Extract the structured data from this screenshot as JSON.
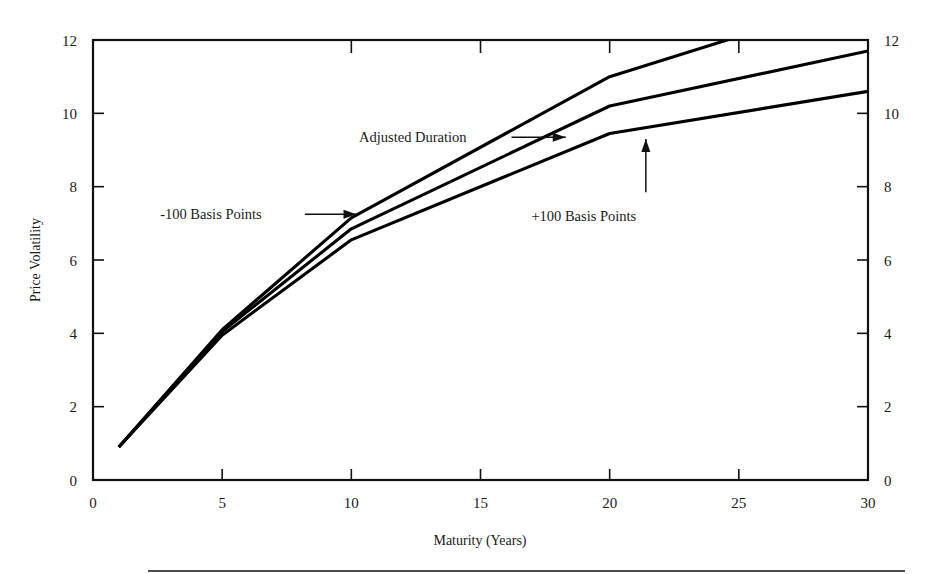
{
  "chart_data": {
    "type": "line",
    "title": "",
    "xlabel": "Maturity (Years)",
    "ylabel": "Price Volatility",
    "xlim": [
      0,
      30
    ],
    "ylim": [
      0,
      12
    ],
    "xticks": [
      0,
      5,
      10,
      15,
      20,
      25,
      30
    ],
    "xticklabels": [
      "0",
      "5",
      "10",
      "15",
      "20",
      "25",
      "30"
    ],
    "yticks": [
      0,
      2,
      4,
      6,
      8,
      10,
      12
    ],
    "yticklabels": [
      "0",
      "2",
      "4",
      "6",
      "8",
      "10",
      "12"
    ],
    "right_axis": true,
    "right_yticks": [
      0,
      2,
      4,
      6,
      8,
      10,
      12
    ],
    "right_yticklabels": [
      "0",
      "2",
      "4",
      "6",
      "8",
      "10",
      "12"
    ],
    "grid": false,
    "legend": "annotations",
    "x": [
      1,
      5,
      10,
      20,
      30
    ],
    "series": [
      {
        "name": "-100 Basis Points",
        "values": [
          0.9,
          4.1,
          7.15,
          11.0,
          13.2
        ],
        "clipped_at_top": true,
        "clip_x": 26.6,
        "clip_y": 12
      },
      {
        "name": "Adjusted Duration",
        "values": [
          0.9,
          4.05,
          6.85,
          10.2,
          11.7
        ]
      },
      {
        "name": "+100 Basis Points",
        "values": [
          0.9,
          3.95,
          6.55,
          9.45,
          10.6
        ]
      }
    ],
    "annotations": [
      {
        "text": "Adjusted Duration",
        "label_x": 10.3,
        "label_y": 9.35,
        "arrow_from_x": 16.2,
        "arrow_from_y": 9.35,
        "arrow_to_x": 18.3,
        "arrow_to_y": 9.35,
        "direction": "right"
      },
      {
        "text": "-100 Basis Points",
        "label_x": 2.6,
        "label_y": 7.25,
        "arrow_from_x": 8.2,
        "arrow_from_y": 7.25,
        "arrow_to_x": 10.2,
        "arrow_to_y": 7.25,
        "direction": "right"
      },
      {
        "text": "+100 Basis Points",
        "label_x": 19.0,
        "label_y": 7.2,
        "arrow_from_x": 21.4,
        "arrow_from_y": 7.85,
        "arrow_to_x": 21.4,
        "arrow_to_y": 9.3,
        "direction": "up"
      }
    ]
  },
  "figure": {
    "bottom_rule": true,
    "background_color": "#ffffff",
    "line_color": "#000000"
  }
}
